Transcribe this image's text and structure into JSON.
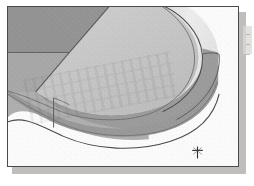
{
  "figure": {
    "caption": "",
    "frame_border_color": "#4a4a4a",
    "frame_background": "#fdfdfd",
    "shadow_color": "#b4b3b1",
    "cursor_marker_label": "crosshair-cursor"
  },
  "model": {
    "description": "Isometric grayscale rendering of an extruded solid with a filleted (rounded) end",
    "faces": [
      {
        "name": "left-vertical-end-face",
        "fill": "#939393",
        "role": "dark side face at upper left"
      },
      {
        "name": "upper-left-side-face",
        "fill": "#a9a9a9",
        "role": "medium side face"
      },
      {
        "name": "top-face",
        "fill": "#c9c9c9",
        "role": "large light top surface"
      },
      {
        "name": "top-chamfer-band",
        "fill": "#e8e8e8",
        "role": "narrow highlight band along rounded top edge"
      },
      {
        "name": "front-left-side-face",
        "fill": "#b6b6b6",
        "role": "front lower-left wall"
      },
      {
        "name": "rounded-nose-wall",
        "fill": "#8f8f8f",
        "role": "curved outer wall of the rounded end"
      },
      {
        "name": "lower-front-wall",
        "fill": "#a2a2a2",
        "role": "lower front wall strip"
      }
    ],
    "edges": [
      {
        "name": "top-silhouette-edge",
        "stroke": "#4f4f4f"
      },
      {
        "name": "fillet-tangent-edge",
        "stroke": "#6b6b6b"
      },
      {
        "name": "vertical-seam-edge",
        "stroke": "#5c5c5c"
      },
      {
        "name": "bottom-silhouette-edge",
        "stroke": "#4a4a4a"
      }
    ],
    "stroke_color": "#4f4f4f",
    "accent_cursor_color": "#3a3a3a"
  },
  "margin": {
    "marks": [
      "",
      "",
      ""
    ]
  }
}
